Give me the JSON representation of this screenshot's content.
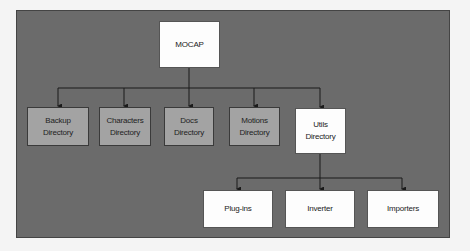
{
  "diagram": {
    "root": {
      "label": "MOCAP"
    },
    "level1": [
      {
        "label_line1": "Backup",
        "label_line2": "Directory",
        "style": "gray"
      },
      {
        "label_line1": "Characters",
        "label_line2": "Directory",
        "style": "gray"
      },
      {
        "label_line1": "Docs",
        "label_line2": "Directory",
        "style": "gray"
      },
      {
        "label_line1": "Motions",
        "label_line2": "Directory",
        "style": "gray"
      },
      {
        "label_line1": "Utils",
        "label_line2": "Directory",
        "style": "white"
      }
    ],
    "level2_parent": "Utils Directory",
    "level2": [
      {
        "label": "Plug-ins"
      },
      {
        "label": "Inverter"
      },
      {
        "label": "Importers"
      }
    ],
    "colors": {
      "background": "#6b6b6b",
      "gray_box": "#a3a3a3",
      "white_box": "#fdfdfd",
      "connector": "#1a1a1a"
    }
  }
}
